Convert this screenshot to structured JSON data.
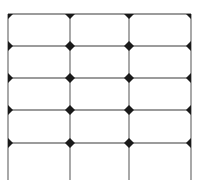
{
  "diagram": {
    "type": "grid-with-junction-markers",
    "background": "#ffffff",
    "line_color": "#7a7a7a",
    "marker_color": "#1a1a1a",
    "columns_x": [
      8,
      70,
      129,
      191
    ],
    "rows_y": [
      14,
      46,
      78,
      110,
      143
    ],
    "bottom_extent_y": 180,
    "marker_size": 10,
    "top_marker_style": "triangle-down",
    "edge_marker_style": "half-diamond",
    "interior_marker_style": "diamond"
  }
}
